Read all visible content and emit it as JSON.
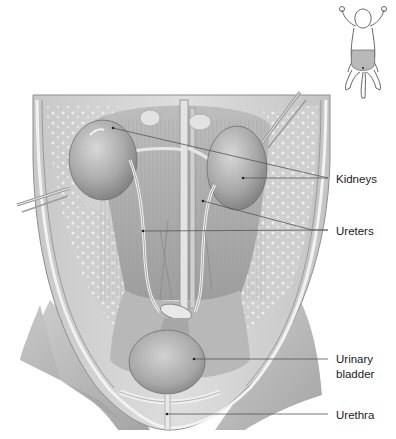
{
  "figure": {
    "orientation_thumbnail": {
      "description": "small line drawing of animal, ventral view, with abdominal region shaded",
      "shade_color": "#b9b9b9"
    },
    "labels": [
      {
        "id": "kidneys",
        "text": "Kidneys",
        "text_y": 172,
        "leader_end": [
          328,
          178
        ],
        "targets": [
          [
            113,
            128
          ],
          [
            243,
            178
          ]
        ]
      },
      {
        "id": "ureters",
        "text": "Ureters",
        "text_y": 224,
        "leader_end": [
          328,
          230
        ],
        "targets": [
          [
            143,
            231
          ],
          [
            203,
            201
          ]
        ]
      },
      {
        "id": "urinary-bladder",
        "text_line1": "Urinary",
        "text_line2": "bladder",
        "text_y": 352,
        "leader_end": [
          328,
          359
        ],
        "targets": [
          [
            194,
            359
          ]
        ]
      },
      {
        "id": "urethra",
        "text": "Urethra",
        "text_y": 408,
        "leader_end": [
          328,
          414
        ],
        "targets": [
          [
            167,
            414
          ]
        ]
      }
    ],
    "colors": {
      "background": "#ffffff",
      "tissue_light": "#d9d9d9",
      "tissue_mid": "#b5b5b5",
      "tissue_dark": "#8a8a8a",
      "leader_line": "#555555",
      "label_text": "#222222"
    }
  }
}
